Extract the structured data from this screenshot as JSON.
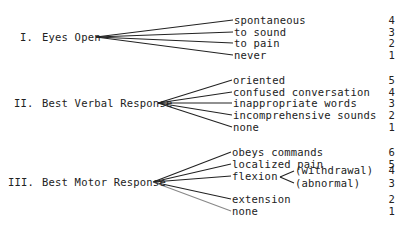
{
  "sections": [
    {
      "numeral": "I.",
      "title": "Eyes Open",
      "responses": [
        {
          "label": "spontaneous",
          "score": "4"
        },
        {
          "label": "to sound",
          "score": "3"
        },
        {
          "label": "to pain",
          "score": "2"
        },
        {
          "label": "never",
          "score": "1"
        }
      ]
    },
    {
      "numeral": "II.",
      "title": "Best Verbal Response",
      "responses": [
        {
          "label": "oriented",
          "score": "5"
        },
        {
          "label": "confused conversation",
          "score": "4"
        },
        {
          "label": "inappropriate words",
          "score": "3"
        },
        {
          "label": "incomprehensive sounds",
          "score": "2"
        },
        {
          "label": "none",
          "score": "1"
        }
      ]
    },
    {
      "numeral": "III.",
      "title": "Best Motor Response",
      "responses": [
        {
          "label": "obeys commands",
          "score": "6"
        },
        {
          "label": "localized pain",
          "score": "5"
        },
        {
          "label": "flexion",
          "score": null,
          "sub": [
            {
              "label": "(withdrawal)",
              "score": "4"
            },
            {
              "label": "(abnormal)",
              "score": "3"
            }
          ]
        },
        {
          "label": "extension",
          "score": "2"
        },
        {
          "label": "none",
          "score": "1"
        }
      ]
    }
  ],
  "colors": {
    "line": "#222222",
    "text": "#222222",
    "background": "#ffffff"
  }
}
